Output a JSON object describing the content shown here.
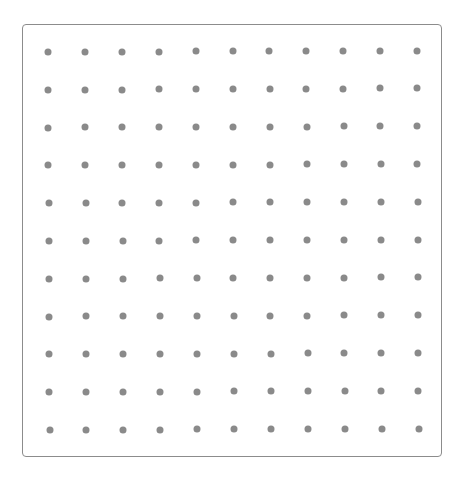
{
  "grid": {
    "rows": 11,
    "cols": 11,
    "dot_color": "#8a8a8a",
    "border_color": "#8c8c8c",
    "background": "#ffffff"
  }
}
